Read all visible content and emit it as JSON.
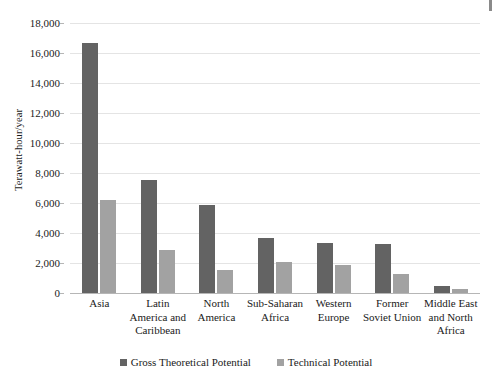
{
  "chart_data": {
    "type": "bar",
    "title": "",
    "subtitle": "",
    "xlabel": "",
    "ylabel": "Terawatt-hour/year",
    "ylim": [
      0,
      18000
    ],
    "ytick_interval": 2000,
    "ytick_labels": [
      "18,000",
      "16,000",
      "14,000",
      "12,000",
      "10,000",
      "8,000",
      "6,000",
      "4,000",
      "2,000",
      "0"
    ],
    "ytick_values": [
      18000,
      16000,
      14000,
      12000,
      10000,
      8000,
      6000,
      4000,
      2000,
      0
    ],
    "grid": true,
    "grid_axis": "y",
    "legend_position": "bottom",
    "categories": [
      "Asia",
      "Latin America and Caribbean",
      "North America",
      "Sub-Saharan Africa",
      "Western Europe",
      "Former Soviet Union",
      "Middle East and North Africa"
    ],
    "category_lines": [
      [
        "Asia"
      ],
      [
        "Latin",
        "America and",
        "Caribbean"
      ],
      [
        "North",
        "America"
      ],
      [
        "Sub-Saharan",
        "Africa"
      ],
      [
        "Western",
        "Europe"
      ],
      [
        "Former",
        "Soviet Union"
      ],
      [
        "Middle East",
        "and North",
        "Africa"
      ]
    ],
    "series": [
      {
        "name": "Gross Theoretical Potential",
        "color": "#636363",
        "values": [
          16650,
          7550,
          5850,
          3650,
          3350,
          3300,
          450
        ]
      },
      {
        "name": "Technical Potential",
        "color": "#a2a2a2",
        "values": [
          6200,
          2850,
          1550,
          2100,
          1900,
          1300,
          250
        ]
      }
    ]
  },
  "legend": {
    "entries": [
      {
        "label": "Gross Theoretical Potential"
      },
      {
        "label": "Technical Potential"
      }
    ]
  }
}
